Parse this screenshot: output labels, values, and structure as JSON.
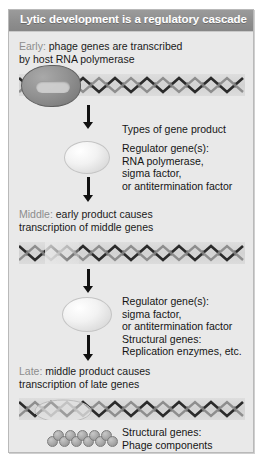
{
  "figure": {
    "title": "Lytic development is a regulatory cascade",
    "background_color": "#e9e9e9",
    "title_bar_color": "#8e8e8e",
    "title_text_color": "#ffffff"
  },
  "stages": [
    {
      "keyword": "Early:",
      "line1_rest": " phage genes are transcribed",
      "line2": "by host RNA polymerase",
      "dna_label": "dna-helix-early",
      "has_polymerase": true
    },
    {
      "keyword": "Middle:",
      "line1_rest": " early product causes",
      "line2": "transcription of middle genes",
      "dna_label": "dna-helix-middle",
      "has_polymerase": false
    },
    {
      "keyword": "Late:",
      "line1_rest": " middle product causes",
      "line2": "transcription of late genes",
      "dna_label": "dna-helix-late",
      "has_polymerase": false
    }
  ],
  "annotations": {
    "types_of_gene_product": "Types of gene product",
    "block1": [
      "Regulator gene(s):",
      "RNA polymerase,",
      "sigma factor,",
      "or antitermination factor"
    ],
    "block2": [
      "Regulator gene(s):",
      "sigma factor,",
      "or antitermination factor",
      "Structural genes:",
      "Replication enzymes, etc."
    ],
    "block3": [
      "Structural genes:",
      "Phage components"
    ]
  },
  "icons": {
    "polymerase": "rna-polymerase-blob",
    "protein_oval": "protein-product-oval",
    "phage_chain": "phage-component-chain",
    "arrow": "down-arrow"
  }
}
